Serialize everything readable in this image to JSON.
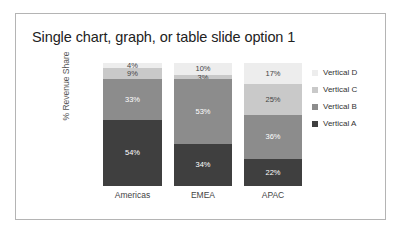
{
  "slide": {
    "title": "Single chart, graph, or table slide option 1"
  },
  "chart_data": {
    "type": "bar",
    "subtype": "stacked-column-100",
    "title": "Single chart, graph, or table slide option 1",
    "xlabel": "",
    "ylabel": "% Revenue Share",
    "ylim": [
      0,
      100
    ],
    "grid": false,
    "legend_position": "right",
    "categories": [
      "Americas",
      "EMEA",
      "APAC"
    ],
    "series": [
      {
        "name": "Vertical A",
        "color": "#3f3f3f",
        "values": [
          54,
          34,
          22
        ],
        "labels": [
          "54%",
          "34%",
          "22%"
        ],
        "label_color": "#ffffff"
      },
      {
        "name": "Vertical B",
        "color": "#8c8c8c",
        "values": [
          33,
          53,
          36
        ],
        "labels": [
          "33%",
          "53%",
          "36%"
        ],
        "label_color": "#ffffff"
      },
      {
        "name": "Vertical C",
        "color": "#c9c9c9",
        "values": [
          9,
          3,
          25
        ],
        "labels": [
          "9%",
          "3%",
          "25%"
        ],
        "label_color": "#444444"
      },
      {
        "name": "Vertical D",
        "color": "#ededed",
        "values": [
          4,
          10,
          17
        ],
        "labels": [
          "4%",
          "10%",
          "17%"
        ],
        "label_color": "#444444"
      }
    ]
  },
  "legend": {
    "items": [
      {
        "label": "Vertical D",
        "color": "#ededed"
      },
      {
        "label": "Vertical C",
        "color": "#c9c9c9"
      },
      {
        "label": "Vertical B",
        "color": "#8c8c8c"
      },
      {
        "label": "Vertical A",
        "color": "#3f3f3f"
      }
    ]
  },
  "colors": {
    "frame_border": "#b4b4b4",
    "background": "#ffffff",
    "title_text": "#222222",
    "axis_text": "#555555"
  }
}
